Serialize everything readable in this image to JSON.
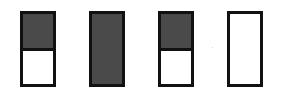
{
  "diagram": {
    "colors": {
      "border": "#111111",
      "fill": "#4a4a4a",
      "empty": "#ffffff"
    },
    "bars": [
      {
        "id": "bar-1",
        "left": 20,
        "shaded_fraction": 0.5,
        "divided": true
      },
      {
        "id": "bar-2",
        "left": 89,
        "shaded_fraction": 1.0,
        "divided": false
      },
      {
        "id": "bar-3",
        "left": 158,
        "shaded_fraction": 0.5,
        "divided": true
      },
      {
        "id": "bar-4",
        "left": 227,
        "shaded_fraction": 0.0,
        "divided": false
      }
    ]
  }
}
